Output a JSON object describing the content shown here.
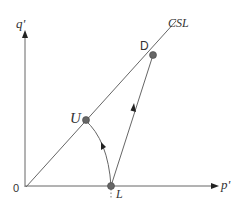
{
  "diagram": {
    "axes": {
      "x_label": "p'",
      "y_label": "q'",
      "origin_label": "0"
    },
    "lines": {
      "csl_label": "CSL"
    },
    "points": {
      "D": {
        "label": "D"
      },
      "U": {
        "label": "U"
      },
      "L": {
        "label": "L"
      }
    },
    "paths": [
      {
        "name": "L-to-U",
        "shape": "curved",
        "direction": "L→U"
      },
      {
        "name": "L-to-D",
        "shape": "straight",
        "direction": "L→D"
      }
    ],
    "colors": {
      "line": "#555555",
      "point_fill": "#666666",
      "text": "#333333"
    }
  }
}
